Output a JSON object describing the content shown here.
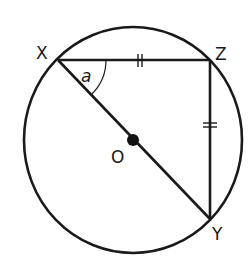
{
  "diagram": {
    "type": "circle-geometry",
    "colors": {
      "stroke": "#1a1a1a",
      "background": "#ffffff"
    },
    "circle": {
      "center_label": "O",
      "center": [
        133,
        140
      ],
      "rx": 109,
      "ry": 113
    },
    "points": {
      "X": {
        "label": "X",
        "pos": [
          58,
          60
        ]
      },
      "Z": {
        "label": "Z",
        "pos": [
          210,
          60
        ]
      },
      "Y": {
        "label": "Y",
        "pos": [
          210,
          219
        ]
      },
      "O": {
        "label": "O",
        "pos": [
          133,
          140
        ]
      }
    },
    "segments": [
      {
        "from": "X",
        "to": "Z",
        "equal_mark": "double-tick"
      },
      {
        "from": "Z",
        "to": "Y",
        "equal_mark": "double-tick"
      },
      {
        "from": "X",
        "to": "Y",
        "passes_through": "O",
        "role": "diameter"
      }
    ],
    "angle": {
      "vertex": "X",
      "between": [
        "Z",
        "Y"
      ],
      "label": "a"
    }
  }
}
